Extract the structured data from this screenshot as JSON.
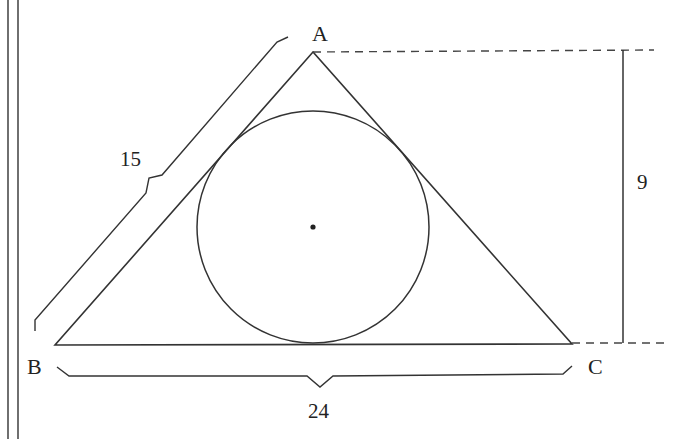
{
  "diagram": {
    "vertices": {
      "A": {
        "label": "A",
        "x": 313,
        "y": 52
      },
      "B": {
        "label": "B",
        "x": 55,
        "y": 345
      },
      "C": {
        "label": "C",
        "x": 572,
        "y": 344
      }
    },
    "incircle": {
      "cx": 313,
      "cy": 227,
      "r": 116,
      "center_dot": true
    },
    "dimensions": {
      "side_AB": {
        "label": "15"
      },
      "side_BC": {
        "label": "24"
      },
      "height": {
        "label": "9"
      }
    },
    "colors": {
      "stroke": "#333333",
      "text": "#222222",
      "background": "#ffffff"
    }
  }
}
